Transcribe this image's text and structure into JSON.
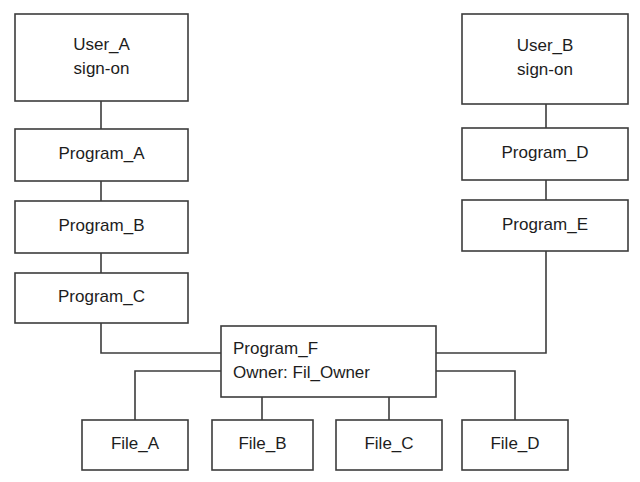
{
  "diagram": {
    "type": "flow-diagram",
    "background_color": "#ffffff",
    "line_color": "#3c3c3c",
    "text_color": "#1d1d1d",
    "nodes": [
      {
        "id": "user-a",
        "lines": [
          "User_A",
          "sign-on"
        ],
        "align": "center",
        "x": 15,
        "y": 14,
        "w": 173,
        "h": 87
      },
      {
        "id": "program-a",
        "lines": [
          "Program_A"
        ],
        "align": "center",
        "x": 15,
        "y": 129,
        "w": 173,
        "h": 52
      },
      {
        "id": "program-b",
        "lines": [
          "Program_B"
        ],
        "align": "center",
        "x": 15,
        "y": 201,
        "w": 173,
        "h": 52
      },
      {
        "id": "program-c",
        "lines": [
          "Program_C"
        ],
        "align": "center",
        "x": 15,
        "y": 273,
        "w": 173,
        "h": 50
      },
      {
        "id": "user-b",
        "lines": [
          "User_B",
          "sign-on"
        ],
        "align": "center",
        "x": 462,
        "y": 14,
        "w": 166,
        "h": 90
      },
      {
        "id": "program-d",
        "lines": [
          "Program_D"
        ],
        "align": "center",
        "x": 462,
        "y": 128,
        "w": 166,
        "h": 52
      },
      {
        "id": "program-e",
        "lines": [
          "Program_E"
        ],
        "align": "center",
        "x": 462,
        "y": 200,
        "w": 166,
        "h": 51
      },
      {
        "id": "program-f",
        "lines": [
          "Program_F",
          "Owner:    Fil_Owner"
        ],
        "align": "left",
        "x": 221,
        "y": 326,
        "w": 215,
        "h": 71
      },
      {
        "id": "file-a",
        "lines": [
          "File_A"
        ],
        "align": "center",
        "x": 82,
        "y": 420,
        "w": 106,
        "h": 50
      },
      {
        "id": "file-b",
        "lines": [
          "File_B"
        ],
        "align": "center",
        "x": 212,
        "y": 420,
        "w": 101,
        "h": 50
      },
      {
        "id": "file-c",
        "lines": [
          "File_C"
        ],
        "align": "center",
        "x": 336,
        "y": 420,
        "w": 106,
        "h": 50
      },
      {
        "id": "file-d",
        "lines": [
          "File_D"
        ],
        "align": "center",
        "x": 462,
        "y": 420,
        "w": 106,
        "h": 50
      }
    ],
    "connectors": [
      {
        "id": "user-a-to-program-a",
        "from": "user-a",
        "to": "program-a",
        "points": [
          [
            101,
            101
          ],
          [
            101,
            129
          ]
        ]
      },
      {
        "id": "program-a-to-program-b",
        "from": "program-a",
        "to": "program-b",
        "points": [
          [
            101,
            181
          ],
          [
            101,
            201
          ]
        ]
      },
      {
        "id": "program-b-to-program-c",
        "from": "program-b",
        "to": "program-c",
        "points": [
          [
            101,
            253
          ],
          [
            101,
            273
          ]
        ]
      },
      {
        "id": "program-c-to-program-f",
        "from": "program-c",
        "to": "program-f",
        "points": [
          [
            101,
            323
          ],
          [
            101,
            353
          ],
          [
            221,
            353
          ]
        ]
      },
      {
        "id": "user-b-to-program-d",
        "from": "user-b",
        "to": "program-d",
        "points": [
          [
            546,
            104
          ],
          [
            546,
            128
          ]
        ]
      },
      {
        "id": "program-d-to-program-e",
        "from": "program-d",
        "to": "program-e",
        "points": [
          [
            546,
            180
          ],
          [
            546,
            200
          ]
        ]
      },
      {
        "id": "program-e-to-program-f",
        "from": "program-e",
        "to": "program-f",
        "points": [
          [
            546,
            251
          ],
          [
            546,
            353
          ],
          [
            436,
            353
          ]
        ]
      },
      {
        "id": "program-f-to-file-a",
        "from": "program-f",
        "to": "file-a",
        "points": [
          [
            221,
            371
          ],
          [
            135,
            371
          ],
          [
            135,
            420
          ]
        ]
      },
      {
        "id": "program-f-to-file-b",
        "from": "program-f",
        "to": "file-b",
        "points": [
          [
            262,
            397
          ],
          [
            262,
            420
          ]
        ]
      },
      {
        "id": "program-f-to-file-c",
        "from": "program-f",
        "to": "file-c",
        "points": [
          [
            389,
            397
          ],
          [
            389,
            420
          ]
        ]
      },
      {
        "id": "program-f-to-file-d",
        "from": "program-f",
        "to": "file-d",
        "points": [
          [
            436,
            371
          ],
          [
            515,
            371
          ],
          [
            515,
            420
          ]
        ]
      }
    ]
  }
}
